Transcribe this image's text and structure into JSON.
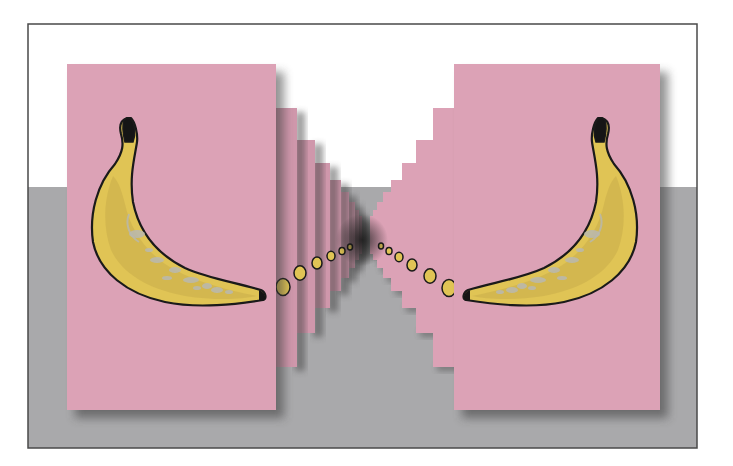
{
  "scene": {
    "title": "Two mirrored banana card stacks receding to a vanishing point",
    "colors": {
      "page_bg": "#ffffff",
      "wall": "#ffffff",
      "floor": "#a9a9ab",
      "frame_border": "#4a4a4a",
      "card": "#dca2b6",
      "card_side": "#c48ea3",
      "shadow": "#3a3a3a",
      "banana_fill": "#e0c455",
      "banana_shade": "#c9ad4a",
      "banana_outline": "#1a1a1a",
      "stem_dark": "#151515",
      "bruise": "#b8b8b0"
    },
    "frame": {
      "x": 28,
      "y": 24,
      "w": 669,
      "h": 424
    },
    "horizon_y": 187,
    "vanishing_point": {
      "x": 366,
      "y": 240
    },
    "left_stack": {
      "front_card": {
        "x": 67,
        "y": 64,
        "w": 209,
        "h": 346
      },
      "back_cards": [
        {
          "right": 297,
          "top": 108,
          "bottom": 367
        },
        {
          "right": 315,
          "top": 140,
          "bottom": 333
        },
        {
          "right": 330,
          "top": 163,
          "bottom": 308
        },
        {
          "right": 341,
          "top": 180,
          "bottom": 291
        },
        {
          "right": 349,
          "top": 192,
          "bottom": 278
        },
        {
          "right": 355,
          "top": 202,
          "bottom": 268
        },
        {
          "right": 359,
          "top": 210,
          "bottom": 260
        },
        {
          "right": 362,
          "top": 216,
          "bottom": 254
        }
      ],
      "peek_tips": [
        {
          "x": 283,
          "y": 287,
          "r": 7
        },
        {
          "x": 300,
          "y": 273,
          "r": 6
        },
        {
          "x": 317,
          "y": 263,
          "r": 5
        },
        {
          "x": 331,
          "y": 256,
          "r": 4
        },
        {
          "x": 342,
          "y": 251,
          "r": 3
        },
        {
          "x": 350,
          "y": 247,
          "r": 2.5
        }
      ]
    },
    "right_stack": {
      "front_card": {
        "x": 454,
        "y": 64,
        "w": 206,
        "h": 346
      },
      "back_cards": [
        {
          "left": 433,
          "top": 108,
          "bottom": 367
        },
        {
          "left": 416,
          "top": 140,
          "bottom": 333
        },
        {
          "left": 402,
          "top": 163,
          "bottom": 308
        },
        {
          "left": 391,
          "top": 180,
          "bottom": 291
        },
        {
          "left": 383,
          "top": 192,
          "bottom": 278
        },
        {
          "left": 377,
          "top": 202,
          "bottom": 268
        },
        {
          "left": 373,
          "top": 210,
          "bottom": 260
        },
        {
          "left": 370,
          "top": 216,
          "bottom": 254
        }
      ],
      "peek_tips": [
        {
          "x": 449,
          "y": 288,
          "r": 7
        },
        {
          "x": 430,
          "y": 276,
          "r": 6
        },
        {
          "x": 412,
          "y": 265,
          "r": 5
        },
        {
          "x": 399,
          "y": 257,
          "r": 4
        },
        {
          "x": 389,
          "y": 251,
          "r": 3
        },
        {
          "x": 381,
          "y": 246,
          "r": 2.5
        }
      ]
    }
  }
}
